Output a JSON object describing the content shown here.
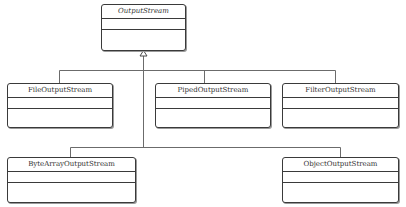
{
  "diagram": {
    "type": "uml-class-inheritance",
    "line_color": "#6b6b6b",
    "box_border_color": "#3a3a3a",
    "root": {
      "id": "output-stream",
      "name": "OutputStream",
      "abstract": true
    },
    "subclasses": [
      {
        "id": "file-output-stream",
        "name": "FileOutputStream"
      },
      {
        "id": "piped-output-stream",
        "name": "PipedOutputStream"
      },
      {
        "id": "filter-output-stream",
        "name": "FilterOutputStream"
      },
      {
        "id": "byte-array-output-stream",
        "name": "ByteArrayOutputStream"
      },
      {
        "id": "object-output-stream",
        "name": "ObjectOutputStream"
      }
    ],
    "relationship": "generalization"
  }
}
